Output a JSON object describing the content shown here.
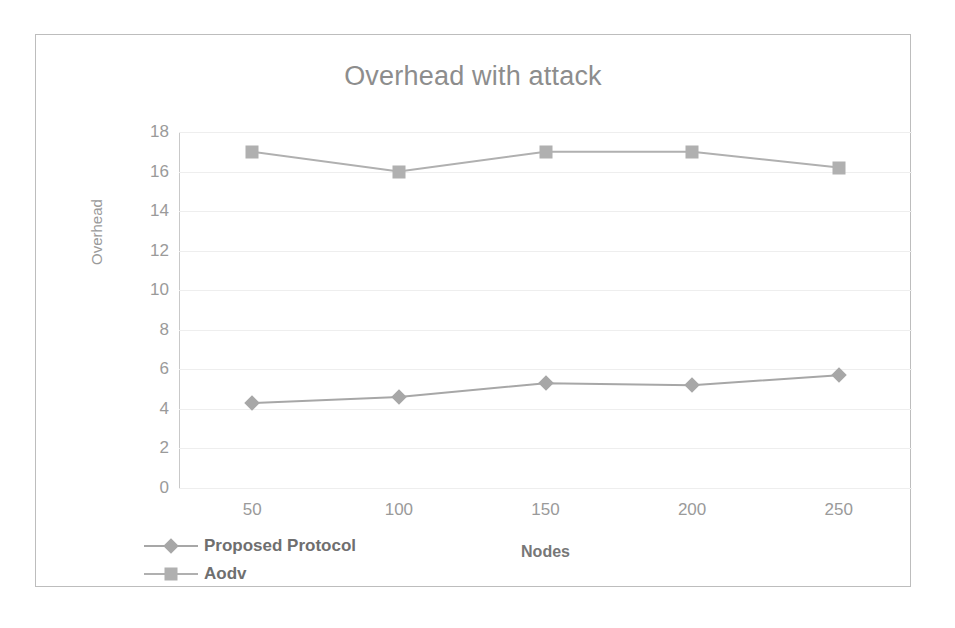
{
  "chart_data": {
    "type": "line",
    "title": "Overhead with attack",
    "xlabel": "Nodes",
    "ylabel": "Overhead",
    "categories": [
      "50",
      "100",
      "150",
      "200",
      "250"
    ],
    "ylim": [
      0,
      18
    ],
    "yticks": [
      "0",
      "2",
      "4",
      "6",
      "8",
      "10",
      "12",
      "14",
      "16",
      "18"
    ],
    "grid": true,
    "legend_position": "bottom-left",
    "series": [
      {
        "name": "Proposed Protocol",
        "marker": "diamond",
        "color": "#a7a7a7",
        "values": [
          4.3,
          4.6,
          5.3,
          5.2,
          5.7
        ]
      },
      {
        "name": "Aodv",
        "marker": "square",
        "color": "#b0b0b0",
        "values": [
          17.0,
          16.0,
          17.0,
          17.0,
          16.2
        ]
      }
    ]
  }
}
